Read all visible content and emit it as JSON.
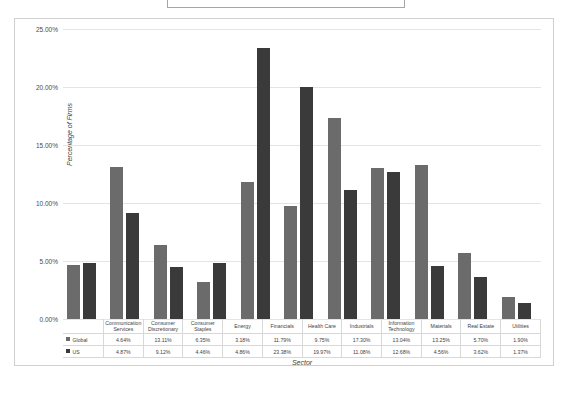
{
  "title_box": {
    "text": ""
  },
  "chart_data": {
    "type": "bar",
    "title": "",
    "xlabel": "Sector",
    "ylabel": "Percentage of Firms",
    "ylim": [
      0,
      25
    ],
    "ytick_labels": [
      "0.00%",
      "5.00%",
      "10.00%",
      "15.00%",
      "20.00%",
      "25.00%"
    ],
    "ytick_values": [
      0,
      5,
      10,
      15,
      20,
      25
    ],
    "grid": true,
    "legend_position": "table-left",
    "categories": [
      "Communication Services",
      "Consumer Discretionary",
      "Consumer Staples",
      "Energy",
      "Financials",
      "Health Care",
      "Industrials",
      "Information Technology",
      "Materials",
      "Real Estate",
      "Utilities"
    ],
    "category_lines": [
      [
        "Communication",
        "Services"
      ],
      [
        "Consumer",
        "Discretionary"
      ],
      [
        "Consumer",
        "Staples"
      ],
      [
        "Energy"
      ],
      [
        "Financials"
      ],
      [
        "Health Care"
      ],
      [
        "Industrials"
      ],
      [
        "Information",
        "Technology"
      ],
      [
        "Materials"
      ],
      [
        "Real Estate"
      ],
      [
        "Utilities"
      ]
    ],
    "series": [
      {
        "name": "Global",
        "color": "#6b6b6b",
        "values": [
          4.64,
          13.11,
          6.35,
          3.18,
          11.79,
          9.75,
          17.3,
          13.04,
          13.25,
          5.7,
          1.9
        ],
        "labels": [
          "4.64%",
          "13.11%",
          "6.35%",
          "3.18%",
          "11.79%",
          "9.75%",
          "17.30%",
          "13.04%",
          "13.25%",
          "5.70%",
          "1.90%"
        ]
      },
      {
        "name": "US",
        "color": "#3a3a3a",
        "values": [
          4.87,
          9.12,
          4.46,
          4.86,
          23.38,
          19.97,
          11.08,
          12.68,
          4.56,
          3.62,
          1.37
        ],
        "labels": [
          "4.87%",
          "9.12%",
          "4.46%",
          "4.86%",
          "23.38%",
          "19.97%",
          "11.08%",
          "12.68%",
          "4.56%",
          "3.62%",
          "1.37%"
        ]
      }
    ]
  }
}
